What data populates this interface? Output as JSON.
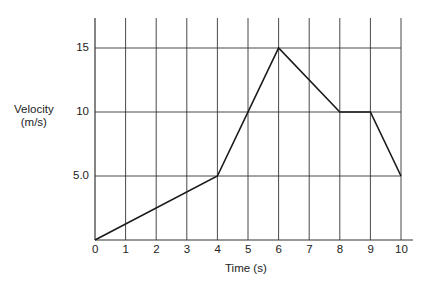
{
  "chart_data": {
    "type": "line",
    "title": "",
    "xlabel": "Time (s)",
    "ylabel": "Velocity (m/s)",
    "ylabel_lines": [
      "Velocity",
      "(m/s)"
    ],
    "x": [
      0,
      4,
      6,
      8,
      9,
      10
    ],
    "series": [
      {
        "name": "velocity",
        "values": [
          0,
          5,
          15,
          10,
          10,
          5
        ]
      }
    ],
    "x_ticks": [
      "0",
      "1",
      "2",
      "3",
      "4",
      "5",
      "6",
      "7",
      "8",
      "9",
      "10"
    ],
    "y_ticks": [
      "5.0",
      "10",
      "15"
    ],
    "y_tick_values": [
      5,
      10,
      15
    ],
    "xlim": [
      0,
      10
    ],
    "ylim": [
      0,
      17.5
    ],
    "grid": true,
    "legend": null
  },
  "style": {
    "line_color": "#1a1a1a",
    "grid_color": "#333333",
    "background": "#ffffff"
  }
}
